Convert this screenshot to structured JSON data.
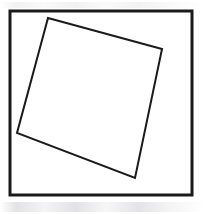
{
  "figure": {
    "background_color": "#ffffff",
    "stroke_color": "#1a1a1a",
    "frame": {
      "name": "outer-square-frame",
      "x": 10,
      "y": 11,
      "width": 182,
      "height": 184,
      "stroke_width": 3
    },
    "inscribed_quadrilateral": {
      "name": "rotated-inner-square",
      "stroke_width": 2,
      "fill": "none",
      "points": "48,18 162,49 135,178 17,133",
      "vertices": [
        {
          "label": "top-vertex",
          "x": 48,
          "y": 18
        },
        {
          "label": "right-vertex",
          "x": 162,
          "y": 49
        },
        {
          "label": "bottom-vertex",
          "x": 135,
          "y": 178
        },
        {
          "label": "left-vertex",
          "x": 17,
          "y": 133
        }
      ]
    },
    "canvas": {
      "width": 204,
      "height": 214
    }
  }
}
